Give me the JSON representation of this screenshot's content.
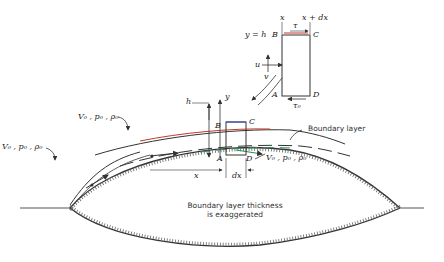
{
  "diagram": {
    "element_labels": {
      "x_left": "x",
      "x_right": "x + dx",
      "tau": "τ",
      "tau_zero": "τ₀",
      "y_eq_h": "y = h",
      "corner_B": "B",
      "corner_C": "C",
      "corner_A": "A",
      "corner_D": "D",
      "u": "u",
      "v": "v"
    },
    "main_labels": {
      "h": "h",
      "y": "y",
      "corner_B": "B",
      "corner_C": "C",
      "corner_A": "A",
      "corner_D": "D",
      "x": "x",
      "dx": "dx"
    },
    "flow_labels": {
      "outer_upper": "V₀ , p₀ , ρ₀",
      "outer_lower": "V₀ , p₀ , ρ₀",
      "right": "V₀ , p₀ , ρ₀"
    },
    "annotations": {
      "boundary_layer": "Boundary layer",
      "thickness_note_line1": "Boundary layer thickness",
      "thickness_note_line2": "is exaggerated"
    },
    "colors": {
      "ink": "#333333",
      "accent_red": "#c0392b",
      "accent_green": "#2e8b57",
      "accent_blue": "#3b4cc0"
    }
  }
}
